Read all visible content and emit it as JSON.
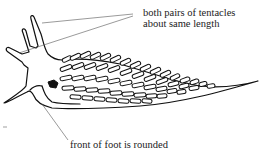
{
  "figure": {
    "annotations": [
      {
        "id": "tentacles",
        "lines": [
          "both pairs of tentacles",
          "about same length"
        ]
      },
      {
        "id": "foot",
        "lines": [
          "front of foot is rounded"
        ]
      }
    ],
    "colors": {
      "ink": "#111111",
      "leader": "#555555",
      "background": "#ffffff"
    }
  }
}
